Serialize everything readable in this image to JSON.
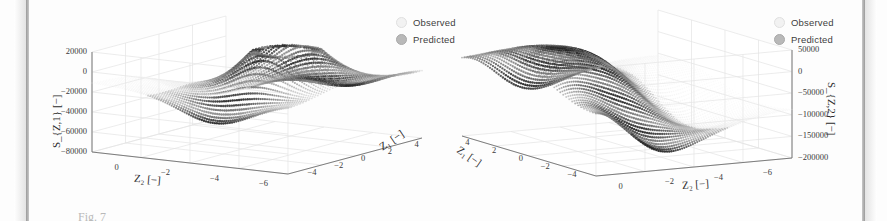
{
  "figure": {
    "caption_fragment": "Fig. 7",
    "panel_count": 2
  },
  "legend": {
    "observed_label": "Observed",
    "predicted_label": "Predicted",
    "observed_color": "#f2f2f2",
    "predicted_color": "#b9b9b9",
    "observed_icon": "scatter-dot-icon",
    "predicted_icon": "scatter-dot-icon"
  },
  "chart_data": [
    {
      "type": "scatter",
      "title": "",
      "projection": "3d",
      "panel": "left",
      "xlabel": "Z_2 [-]",
      "ylabel": "Z_1 [-]",
      "zlabel": "S_Z,1 [-]",
      "xlabel_display": "Z₂ [−]",
      "ylabel_display": "Z₁ [−]",
      "zlabel_display": "S_{Z,1} [−]",
      "xticks": [
        0,
        -2,
        -4,
        -6
      ],
      "xticklabels": [
        "0",
        "−2",
        "−4",
        "−6"
      ],
      "yticks": [
        -4,
        -2,
        0,
        2,
        4
      ],
      "yticklabels": [
        "−4",
        "−2",
        "0",
        "2",
        "4"
      ],
      "zticks": [
        20000,
        0,
        -20000,
        -40000,
        -60000,
        -80000
      ],
      "zticklabels": [
        "20000",
        "0",
        "−20000",
        "−40000",
        "−60000",
        "−80000"
      ],
      "xlim": [
        1,
        -7
      ],
      "ylim": [
        -5,
        5
      ],
      "zlim": [
        -90000,
        30000
      ],
      "grid": true,
      "legend_position": "upper right",
      "series": [
        {
          "name": "Observed",
          "marker": "dot",
          "color": "#e8e8e8"
        },
        {
          "name": "Predicted",
          "marker": "dot",
          "color": "#555555"
        }
      ],
      "surface_description": "folded saddle ribbon sheet, dark ribbed striations, decaying tail toward +Z1"
    },
    {
      "type": "scatter",
      "title": "",
      "projection": "3d",
      "panel": "right",
      "xlabel": "Z_2 [-]",
      "ylabel": "Z_1 [-]",
      "zlabel": "S_Z,2 [-]",
      "xlabel_display": "Z₂ [−]",
      "ylabel_display": "Z₁ [−]",
      "zlabel_display": "S_{Z,2} [−]",
      "xticks": [
        -6,
        -4,
        -2,
        0
      ],
      "xticklabels": [
        "−6",
        "−4",
        "−2",
        "0"
      ],
      "yticks": [
        -4,
        -2,
        0,
        2,
        4
      ],
      "yticklabels": [
        "−4",
        "−2",
        "0",
        "2",
        "4"
      ],
      "zticks": [
        50000,
        0,
        -50000,
        -100000,
        -150000,
        -200000
      ],
      "zticklabels": [
        "50000",
        "0",
        "−50000",
        "−100000",
        "−150000",
        "−200000"
      ],
      "xlim": [
        -7,
        1
      ],
      "ylim": [
        -5,
        5
      ],
      "zlim": [
        -210000,
        70000
      ],
      "grid": true,
      "legend_position": "upper right",
      "series": [
        {
          "name": "Observed",
          "marker": "dot",
          "color": "#e8e8e8"
        },
        {
          "name": "Predicted",
          "marker": "dot",
          "color": "#555555"
        }
      ],
      "surface_description": "S-curved ribbon sheet rising to right, sparse dotted tail toward lower-left"
    }
  ]
}
